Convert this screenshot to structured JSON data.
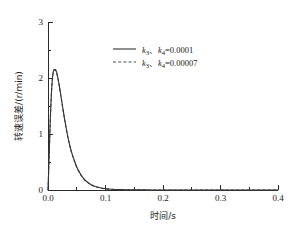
{
  "chart_data": {
    "type": "line",
    "title": "",
    "xlabel": "时间/s",
    "ylabel": "转速误差/(r/min)",
    "xlim": [
      0.0,
      0.4
    ],
    "ylim": [
      0,
      3
    ],
    "xticks": [
      0.0,
      0.1,
      0.2,
      0.3,
      0.4
    ],
    "xtick_labels": [
      "0.0",
      "0.1",
      "0.2",
      "0.3",
      "0.4"
    ],
    "yticks": [
      0,
      1,
      2,
      3
    ],
    "ytick_labels": [
      "0",
      "1",
      "2",
      "3"
    ],
    "xminor_ticks": [
      0.05,
      0.15,
      0.25,
      0.35
    ],
    "yminor_ticks": [
      0.5,
      1.5,
      2.5
    ],
    "grid": false,
    "legend_position": "upper-center",
    "peak": {
      "x": 0.013,
      "y": 2.15
    },
    "series": [
      {
        "name": "k3_k4_0.0001",
        "label": "k₃、k₄=0.0001",
        "style": "solid",
        "color": "#333333",
        "x": [
          0.0,
          0.001,
          0.002,
          0.003,
          0.004,
          0.005,
          0.006,
          0.007,
          0.008,
          0.009,
          0.01,
          0.011,
          0.012,
          0.013,
          0.014,
          0.015,
          0.016,
          0.017,
          0.018,
          0.019,
          0.02,
          0.022,
          0.024,
          0.026,
          0.028,
          0.03,
          0.033,
          0.036,
          0.039,
          0.042,
          0.045,
          0.05,
          0.055,
          0.06,
          0.065,
          0.07,
          0.075,
          0.08,
          0.085,
          0.09,
          0.095,
          0.1,
          0.11,
          0.12,
          0.13,
          0.14,
          0.16,
          0.18,
          0.2,
          0.25,
          0.3,
          0.35,
          0.4
        ],
        "y": [
          0.0,
          0.3,
          0.62,
          0.95,
          1.26,
          1.52,
          1.74,
          1.9,
          2.02,
          2.1,
          2.14,
          2.15,
          2.15,
          2.15,
          2.13,
          2.1,
          2.06,
          2.01,
          1.96,
          1.9,
          1.84,
          1.71,
          1.58,
          1.45,
          1.32,
          1.2,
          1.03,
          0.88,
          0.75,
          0.64,
          0.55,
          0.41,
          0.31,
          0.23,
          0.17,
          0.13,
          0.095,
          0.071,
          0.053,
          0.04,
          0.03,
          0.023,
          0.014,
          0.009,
          0.006,
          0.004,
          0.002,
          0.001,
          0.001,
          0.0,
          0.0,
          0.0,
          0.0
        ]
      },
      {
        "name": "k3_k4_0.00007",
        "label": "k₃、k₄=0.00007",
        "style": "dashed",
        "color": "#4a4a4a",
        "x": [
          0.0,
          0.001,
          0.002,
          0.003,
          0.004,
          0.005,
          0.006,
          0.007,
          0.008,
          0.009,
          0.01,
          0.011,
          0.012,
          0.013,
          0.014,
          0.015,
          0.016,
          0.017,
          0.018,
          0.019,
          0.02,
          0.022,
          0.024,
          0.026,
          0.028,
          0.03,
          0.033,
          0.036,
          0.039,
          0.042,
          0.045,
          0.05,
          0.055,
          0.06,
          0.065,
          0.07,
          0.075,
          0.08,
          0.085,
          0.09,
          0.095,
          0.1,
          0.11,
          0.12,
          0.13,
          0.14,
          0.16,
          0.18,
          0.2,
          0.25,
          0.3,
          0.35,
          0.4
        ],
        "y": [
          0.0,
          0.29,
          0.61,
          0.94,
          1.25,
          1.51,
          1.73,
          1.89,
          2.01,
          2.09,
          2.13,
          2.14,
          2.14,
          2.14,
          2.12,
          2.09,
          2.05,
          2.0,
          1.95,
          1.89,
          1.83,
          1.7,
          1.57,
          1.44,
          1.31,
          1.19,
          1.02,
          0.87,
          0.745,
          0.635,
          0.545,
          0.405,
          0.305,
          0.228,
          0.168,
          0.128,
          0.093,
          0.069,
          0.052,
          0.039,
          0.029,
          0.022,
          0.013,
          0.0085,
          0.0055,
          0.0038,
          0.0018,
          0.001,
          0.0008,
          0.0,
          0.0,
          0.0,
          0.0
        ]
      }
    ]
  },
  "legend": {
    "entries": [
      {
        "prefix": "k",
        "sub1": "3",
        "sep": "、",
        "prefix2": "k",
        "sub2": "4",
        "value": "=0.0001"
      },
      {
        "prefix": "k",
        "sub1": "3",
        "sep": "、",
        "prefix2": "k",
        "sub2": "4",
        "value": "=0.00007"
      }
    ],
    "entry1_k1": "k",
    "entry1_s1": "3",
    "entry1_sep": "、",
    "entry1_k2": "k",
    "entry1_s2": "4",
    "entry1_val": "=0.0001",
    "entry2_k1": "k",
    "entry2_s1": "3",
    "entry2_sep": "、",
    "entry2_k2": "k",
    "entry2_s2": "4",
    "entry2_val": "=0.00007"
  },
  "axes": {
    "x_label": "时间/s",
    "y_label": "转速误差/(r/min)",
    "x_tick_0": "0.0",
    "x_tick_1": "0.1",
    "x_tick_2": "0.2",
    "x_tick_3": "0.3",
    "x_tick_4": "0.4",
    "y_tick_0": "0",
    "y_tick_1": "1",
    "y_tick_2": "2",
    "y_tick_3": "3"
  },
  "colors": {
    "axis": "#2b2b2b",
    "solid_series": "#333333",
    "dashed_series": "#4a4a4a",
    "background": "#ffffff"
  }
}
